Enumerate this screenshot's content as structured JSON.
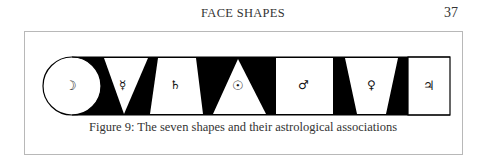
{
  "header": {
    "running_title": "FACE SHAPES",
    "page_number": "37"
  },
  "figure": {
    "caption": "Figure 9: The seven shapes and their astrological associations",
    "shapes": [
      {
        "name": "round",
        "planet": "Moon",
        "symbol": "☽"
      },
      {
        "name": "inverted-triangle",
        "planet": "Mercury",
        "symbol": "☿"
      },
      {
        "name": "trapezoid",
        "planet": "Saturn",
        "symbol": "♄"
      },
      {
        "name": "triangle",
        "planet": "Sun",
        "symbol": "☉"
      },
      {
        "name": "square",
        "planet": "Mars",
        "symbol": "♂"
      },
      {
        "name": "inverted-trapezoid",
        "planet": "Venus",
        "symbol": "♀"
      },
      {
        "name": "rectangle",
        "planet": "Jupiter",
        "symbol": "♃"
      }
    ],
    "colors": {
      "ink": "#000000",
      "paper": "#ffffff",
      "frame": "#b8b8b8"
    }
  }
}
